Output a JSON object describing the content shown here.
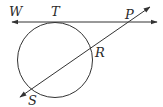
{
  "diagram": {
    "type": "circle-tangent-secant",
    "labels": {
      "W": "W",
      "T": "T",
      "P": "P",
      "R": "R",
      "S": "S"
    },
    "colors": {
      "stroke": "#333333",
      "text": "#2a2a2a"
    }
  }
}
